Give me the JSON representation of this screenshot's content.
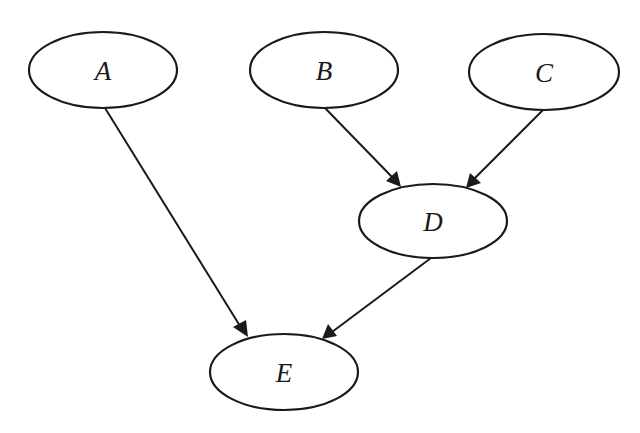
{
  "diagram": {
    "type": "directed-acyclic-graph",
    "nodes": [
      {
        "id": "A",
        "label": "A",
        "cx": 103,
        "cy": 70,
        "rx": 74,
        "ry": 38
      },
      {
        "id": "B",
        "label": "B",
        "cx": 324,
        "cy": 70,
        "rx": 74,
        "ry": 38
      },
      {
        "id": "C",
        "label": "C",
        "cx": 544,
        "cy": 72,
        "rx": 75,
        "ry": 38
      },
      {
        "id": "D",
        "label": "D",
        "cx": 433,
        "cy": 221,
        "rx": 74,
        "ry": 37
      },
      {
        "id": "E",
        "label": "E",
        "cx": 284,
        "cy": 372,
        "rx": 74,
        "ry": 38
      }
    ],
    "edges": [
      {
        "from": "A",
        "to": "E"
      },
      {
        "from": "B",
        "to": "D"
      },
      {
        "from": "C",
        "to": "D"
      },
      {
        "from": "D",
        "to": "E"
      }
    ],
    "colors": {
      "stroke": "#1a1a1a",
      "fill": "#ffffff",
      "background": "#ffffff"
    }
  }
}
